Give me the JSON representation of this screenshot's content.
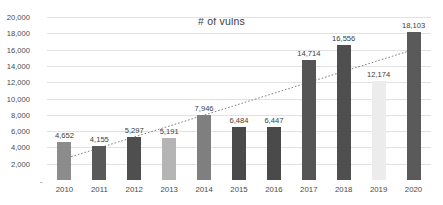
{
  "chart_data": {
    "type": "bar",
    "title": "# of vulns",
    "xlabel": "",
    "ylabel": "",
    "categories": [
      "2010",
      "2011",
      "2012",
      "2013",
      "2014",
      "2015",
      "2016",
      "2017",
      "2018",
      "2019",
      "2020"
    ],
    "values": [
      4652,
      4155,
      5297,
      5191,
      7946,
      6484,
      6447,
      14714,
      16556,
      12174,
      18103
    ],
    "value_labels": [
      "4,652",
      "4,155",
      "5,297",
      "5,191",
      "7,946",
      "6,484",
      "6,447",
      "14,714",
      "16,556",
      "12,174",
      "18,103"
    ],
    "bar_colors": [
      "#8c8c8c",
      "#595959",
      "#4f4f4f",
      "#b5b5b5",
      "#7f7f7f",
      "#4a4a4a",
      "#4a4a4a",
      "#555555",
      "#4f4f4f",
      "#ececec",
      "#5a5a5a"
    ],
    "ylim": [
      0,
      20000
    ],
    "ytick_values": [
      0,
      2000,
      4000,
      6000,
      8000,
      10000,
      12000,
      14000,
      16000,
      18000,
      20000
    ],
    "ytick_labels": [
      "-",
      "2,000",
      "4,000",
      "6,000",
      "8,000",
      "10,000",
      "12,000",
      "14,000",
      "16,000",
      "18,000",
      "20,000"
    ],
    "grid": true,
    "legend": false,
    "trendline": {
      "type": "linear",
      "style": "dotted",
      "color": "#808080",
      "start_value": 2600,
      "end_value": 16000
    }
  }
}
